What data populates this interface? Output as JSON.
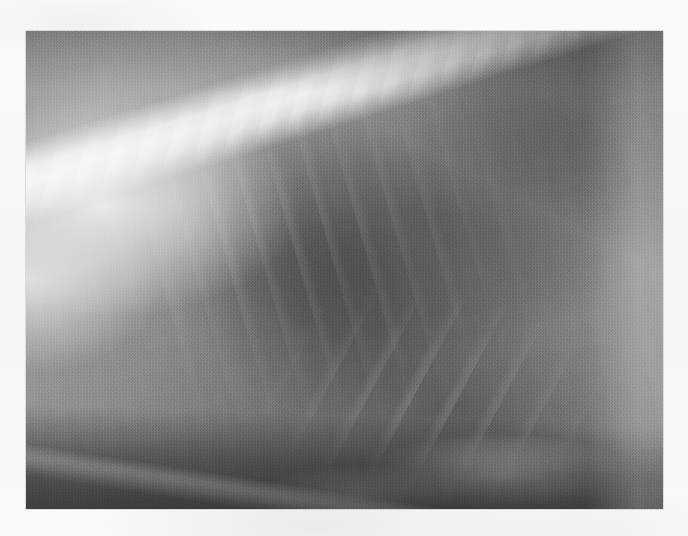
{
  "page": {
    "width": 688,
    "height": 536,
    "background_color": "#f8f8f6",
    "content_type": "scanned-radiograph",
    "caption": ""
  },
  "radiograph": {
    "name": "lateral-thoracic-radiograph",
    "modality": "X-ray",
    "view": "lateral",
    "region": "thorax",
    "alt_text": "Lateral thoracic radiograph showing vertebral column, rib cage, cardiac silhouette and diaphragm",
    "frame": {
      "x": 26,
      "y": 31,
      "width": 637,
      "height": 478
    },
    "tones": {
      "darkest": "#2c2c2c",
      "dark": "#4a4a48",
      "mid": "#7b7b79",
      "light": "#c9c9c6",
      "brightest": "#e8e8e5"
    },
    "features": [
      {
        "id": "vertebral-column",
        "label": "Vertebral column",
        "tone": "brightest"
      },
      {
        "id": "scapular-soft-tissue",
        "label": "Shoulder soft tissue",
        "tone": "brightest"
      },
      {
        "id": "lung-field",
        "label": "Lung field",
        "tone": "darkest"
      },
      {
        "id": "cardiac-silhouette",
        "label": "Cardiac silhouette",
        "tone": "dark"
      },
      {
        "id": "rib-arcs",
        "label": "Rib arcs",
        "tone": "light"
      },
      {
        "id": "sternum",
        "label": "Sternum",
        "tone": "brightest"
      },
      {
        "id": "diaphragm",
        "label": "Diaphragm",
        "tone": "light"
      },
      {
        "id": "abdominal-soft-tissue",
        "label": "Abdominal soft tissue",
        "tone": "darkest"
      }
    ]
  }
}
